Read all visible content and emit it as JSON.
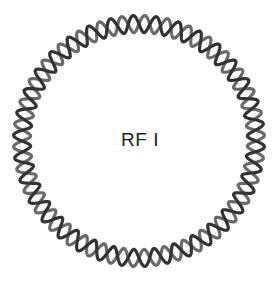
{
  "diagram": {
    "type": "circular-double-stranded-dna",
    "label": "RF I",
    "center": [
      139,
      141
    ],
    "radius": 117,
    "amplitude": 8.5,
    "turns": 34,
    "strands": [
      {
        "name": "strand-a",
        "color": "#333333",
        "phase": 0
      },
      {
        "name": "strand-b",
        "color": "#6a6a6a",
        "phase": 3.14159
      }
    ],
    "stroke_width": 3.2
  }
}
